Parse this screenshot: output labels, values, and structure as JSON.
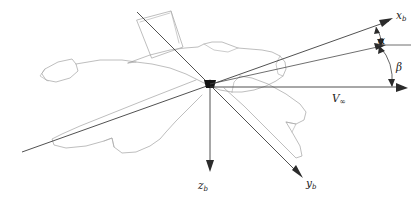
{
  "figure": {
    "name": "aircraft-body-axes-diagram",
    "background_color": "#ffffff",
    "axis_color": "#3d3d3d",
    "aircraft_outline_color": "#9a9a9a",
    "origin": {
      "x": 210,
      "y": 83
    }
  },
  "labels": {
    "x_axis": {
      "symbol": "x",
      "subscript": "b",
      "full": "x_b"
    },
    "y_axis": {
      "symbol": "y",
      "subscript": "b",
      "full": "y_b"
    },
    "z_axis": {
      "symbol": "z",
      "subscript": "b",
      "full": "z_b"
    },
    "alpha": {
      "symbol": "α",
      "full": "α"
    },
    "beta": {
      "symbol": "β",
      "full": "β"
    },
    "velocity": {
      "symbol": "V",
      "subscript": "∞",
      "full": "V∞"
    }
  },
  "geometry": {
    "x_axis_tip": {
      "x": 393,
      "y": 18
    },
    "y_axis_tip": {
      "x": 303,
      "y": 178
    },
    "z_axis_tip": {
      "x": 210,
      "y": 172
    },
    "velocity_tip": {
      "x": 408,
      "y": 88
    },
    "alpha_reference_line": {
      "x1": 379,
      "y1": 45,
      "x2": 410,
      "y2": 45
    },
    "beta_reference_tip": {
      "x": 386,
      "y": 44
    }
  }
}
